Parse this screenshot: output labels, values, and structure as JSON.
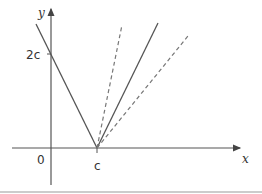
{
  "diagram": {
    "axes": {
      "x_label": "x",
      "y_label": "y",
      "origin_label": "0"
    },
    "tick_labels": {
      "y_tick": "2c",
      "x_tick": "c"
    },
    "graphs": [
      {
        "name": "y = |2x - 2c|",
        "style": "solid",
        "description": "V-shaped graph with vertex at (c, 0), y-intercept 2c"
      },
      {
        "name": "steeper line through (c,0)",
        "style": "dashed"
      },
      {
        "name": "shallower line through (c,0)",
        "style": "dashed"
      }
    ],
    "colors": {
      "axis": "#555555",
      "solid_line": "#555555",
      "dashed_line": "#777777",
      "border": "#999999"
    }
  }
}
